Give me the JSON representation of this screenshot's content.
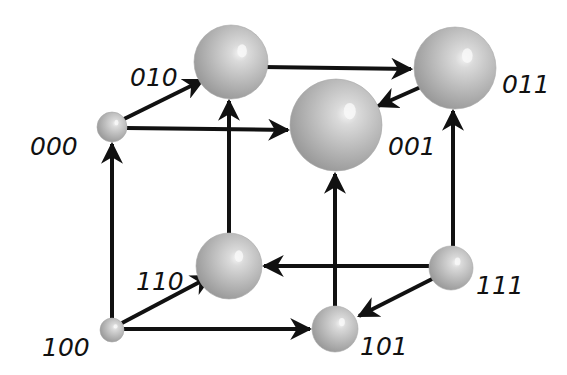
{
  "diagram": {
    "title": "",
    "type": "state-transition cube",
    "colors": {
      "background": "#ffffff",
      "edge": "#111111",
      "sphere_light": "#e4e4e4",
      "sphere_mid": "#b9b9b9",
      "sphere_dark": "#8e8e8e",
      "label": "#111111"
    },
    "nodes": [
      {
        "id": "000",
        "label": "000",
        "cx": 112,
        "cy": 127,
        "r": 15,
        "label_x": 30,
        "label_y": 155
      },
      {
        "id": "010",
        "label": "010",
        "cx": 231,
        "cy": 62,
        "r": 37,
        "label_x": 130,
        "label_y": 86
      },
      {
        "id": "011",
        "label": "011",
        "cx": 455,
        "cy": 68,
        "r": 41,
        "label_x": 502,
        "label_y": 93
      },
      {
        "id": "001",
        "label": "001",
        "cx": 336,
        "cy": 125,
        "r": 46,
        "label_x": 388,
        "label_y": 155
      },
      {
        "id": "110",
        "label": "110",
        "cx": 229,
        "cy": 266,
        "r": 33,
        "label_x": 136,
        "label_y": 290
      },
      {
        "id": "111",
        "label": "111",
        "cx": 451,
        "cy": 268,
        "r": 22,
        "label_x": 476,
        "label_y": 294
      },
      {
        "id": "100",
        "label": "100",
        "cx": 112,
        "cy": 330,
        "r": 12,
        "label_x": 42,
        "label_y": 356
      },
      {
        "id": "101",
        "label": "101",
        "cx": 335,
        "cy": 329,
        "r": 23,
        "label_x": 360,
        "label_y": 355
      }
    ],
    "edges": [
      {
        "from": "100",
        "to": "000",
        "x1": 112,
        "y1": 318,
        "x2": 112,
        "y2": 144
      },
      {
        "from": "100",
        "to": "110",
        "x1": 122,
        "y1": 323,
        "x2": 211,
        "y2": 276
      },
      {
        "from": "100",
        "to": "101",
        "x1": 124,
        "y1": 329,
        "x2": 310,
        "y2": 329
      },
      {
        "from": "000",
        "to": "010",
        "x1": 124,
        "y1": 119,
        "x2": 203,
        "y2": 80
      },
      {
        "from": "000",
        "to": "001",
        "x1": 127,
        "y1": 128,
        "x2": 288,
        "y2": 130
      },
      {
        "from": "110",
        "to": "010",
        "x1": 229,
        "y1": 233,
        "x2": 229,
        "y2": 101
      },
      {
        "from": "111",
        "to": "110",
        "x1": 429,
        "y1": 266,
        "x2": 264,
        "y2": 266
      },
      {
        "from": "111",
        "to": "101",
        "x1": 438,
        "y1": 276,
        "x2": 359,
        "y2": 316
      },
      {
        "from": "111",
        "to": "011",
        "x1": 453,
        "y1": 246,
        "x2": 453,
        "y2": 111
      },
      {
        "from": "101",
        "to": "001",
        "x1": 335,
        "y1": 306,
        "x2": 335,
        "y2": 174
      },
      {
        "from": "010",
        "to": "011",
        "x1": 263,
        "y1": 67,
        "x2": 411,
        "y2": 69
      },
      {
        "from": "011",
        "to": "001",
        "x1": 432,
        "y1": 82,
        "x2": 378,
        "y2": 106
      }
    ]
  }
}
